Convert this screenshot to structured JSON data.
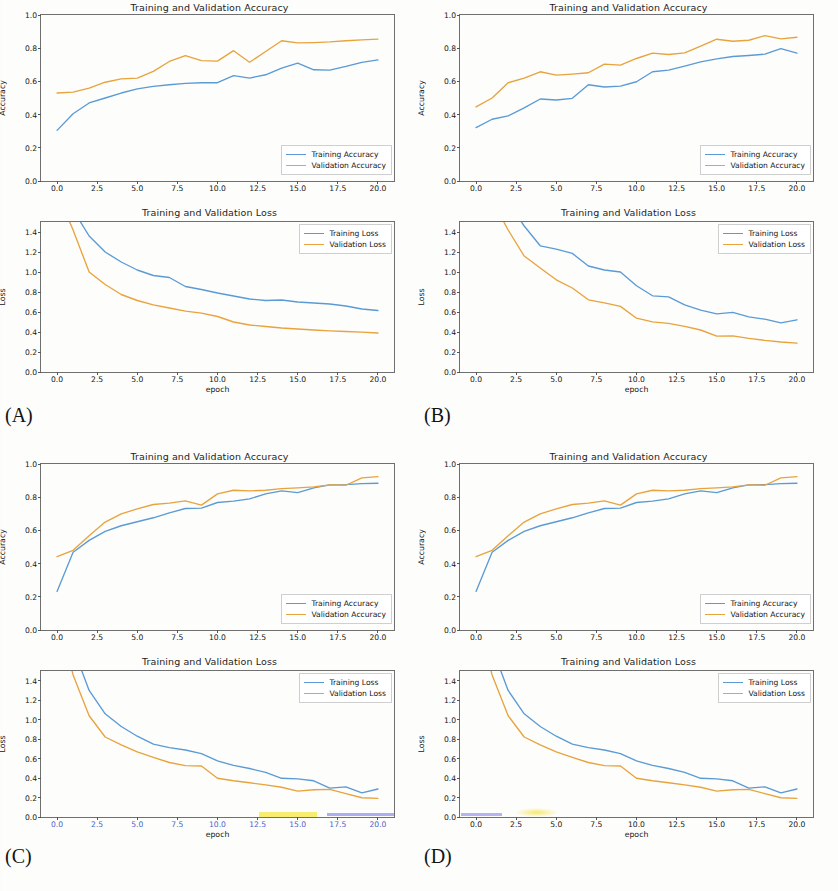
{
  "figure": {
    "panels": [
      {
        "id": "A",
        "caption": "(A)"
      },
      {
        "id": "B",
        "caption": "(B)"
      },
      {
        "id": "C",
        "caption": "(C)"
      },
      {
        "id": "D",
        "caption": "(D)"
      }
    ],
    "colors": {
      "training": "#5b9bd5",
      "validation": "#e8a33d",
      "axis": "#6f6f6f",
      "text": "#151515"
    },
    "titles": {
      "accuracy": "Training and Validation Accuracy",
      "loss": "Training and Validation Loss"
    },
    "axis_labels": {
      "accuracy_y": "Accuracy",
      "loss_y": "Loss",
      "x": "epoch"
    },
    "legend_labels": {
      "training_accuracy": "Training Accuracy",
      "validation_accuracy": "Validation Accuracy",
      "training_loss": "Training Loss",
      "validation_loss": "Validation Loss"
    },
    "ticks": {
      "x": [
        "0.0",
        "2.5",
        "5.0",
        "7.5",
        "10.0",
        "12.5",
        "15.0",
        "17.5",
        "20.0"
      ],
      "y_accuracy": [
        "0.0",
        "0.2",
        "0.4",
        "0.6",
        "0.8",
        "1.0"
      ],
      "y_loss": [
        "0.0",
        "0.2",
        "0.4",
        "0.6",
        "0.8",
        "1.0",
        "1.2",
        "1.4"
      ]
    }
  },
  "chart_data": [
    {
      "id": "A-accuracy",
      "panel": "A",
      "type": "line",
      "title": "Training and Validation Accuracy",
      "xlabel": "",
      "ylabel": "Accuracy",
      "xlim": [
        -1.0,
        21.0
      ],
      "ylim": [
        0.0,
        1.0
      ],
      "xticks": [
        0.0,
        2.5,
        5.0,
        7.5,
        10.0,
        12.5,
        15.0,
        17.5,
        20.0
      ],
      "yticks": [
        0.0,
        0.2,
        0.4,
        0.6,
        0.8,
        1.0
      ],
      "grid": false,
      "legend_position": "lower right",
      "x": [
        0,
        1,
        2,
        3,
        4,
        5,
        6,
        7,
        8,
        9,
        10,
        11,
        12,
        13,
        14,
        15,
        16,
        17,
        18,
        19,
        20
      ],
      "series": [
        {
          "name": "Training Accuracy",
          "color": "#5b9bd5",
          "values": [
            0.305,
            0.405,
            0.47,
            0.5,
            0.53,
            0.555,
            0.57,
            0.58,
            0.588,
            0.592,
            0.592,
            0.635,
            0.62,
            0.64,
            0.68,
            0.71,
            0.67,
            0.668,
            0.69,
            0.715,
            0.73
          ]
        },
        {
          "name": "Validation Accuracy",
          "color": "#e8a33d",
          "values": [
            0.53,
            0.535,
            0.56,
            0.595,
            0.615,
            0.62,
            0.66,
            0.72,
            0.755,
            0.725,
            0.722,
            0.785,
            0.715,
            0.78,
            0.845,
            0.832,
            0.834,
            0.838,
            0.845,
            0.85,
            0.855
          ]
        }
      ]
    },
    {
      "id": "A-loss",
      "panel": "A",
      "type": "line",
      "title": "Training and Validation Loss",
      "xlabel": "epoch",
      "ylabel": "Loss",
      "xlim": [
        -1.0,
        21.0
      ],
      "ylim": [
        0.0,
        1.5
      ],
      "xticks": [
        0.0,
        2.5,
        5.0,
        7.5,
        10.0,
        12.5,
        15.0,
        17.5,
        20.0
      ],
      "yticks": [
        0.0,
        0.2,
        0.4,
        0.6,
        0.8,
        1.0,
        1.2,
        1.4
      ],
      "grid": false,
      "legend_position": "upper right",
      "x": [
        0,
        1,
        2,
        3,
        4,
        5,
        6,
        7,
        8,
        9,
        10,
        11,
        12,
        13,
        14,
        15,
        16,
        17,
        18,
        19,
        20
      ],
      "series": [
        {
          "name": "Training Loss",
          "color": "#5b9bd5",
          "values": [
            2.05,
            1.62,
            1.36,
            1.2,
            1.1,
            1.02,
            0.965,
            0.945,
            0.855,
            0.825,
            0.79,
            0.76,
            0.73,
            0.715,
            0.72,
            0.7,
            0.69,
            0.68,
            0.66,
            0.63,
            0.615
          ]
        },
        {
          "name": "Validation Loss",
          "color": "#e8a33d",
          "values": [
            1.8,
            1.42,
            1.0,
            0.875,
            0.775,
            0.715,
            0.672,
            0.64,
            0.608,
            0.588,
            0.555,
            0.5,
            0.47,
            0.455,
            0.44,
            0.43,
            0.42,
            0.412,
            0.405,
            0.398,
            0.39
          ]
        }
      ]
    },
    {
      "id": "B-accuracy",
      "panel": "B",
      "type": "line",
      "title": "Training and Validation Accuracy",
      "xlabel": "",
      "ylabel": "Accuracy",
      "xlim": [
        -1.0,
        21.0
      ],
      "ylim": [
        0.0,
        1.0
      ],
      "xticks": [
        0.0,
        2.5,
        5.0,
        7.5,
        10.0,
        12.5,
        15.0,
        17.5,
        20.0
      ],
      "yticks": [
        0.0,
        0.2,
        0.4,
        0.6,
        0.8,
        1.0
      ],
      "grid": false,
      "legend_position": "lower right",
      "x": [
        0,
        1,
        2,
        3,
        4,
        5,
        6,
        7,
        8,
        9,
        10,
        11,
        12,
        13,
        14,
        15,
        16,
        17,
        18,
        19,
        20
      ],
      "series": [
        {
          "name": "Training Accuracy",
          "color": "#5b9bd5",
          "values": [
            0.322,
            0.372,
            0.392,
            0.44,
            0.494,
            0.488,
            0.498,
            0.58,
            0.566,
            0.572,
            0.598,
            0.658,
            0.668,
            0.692,
            0.718,
            0.736,
            0.75,
            0.756,
            0.764,
            0.798,
            0.77
          ]
        },
        {
          "name": "Validation Accuracy",
          "color": "#e8a33d",
          "values": [
            0.446,
            0.5,
            0.592,
            0.62,
            0.658,
            0.638,
            0.644,
            0.652,
            0.704,
            0.698,
            0.738,
            0.77,
            0.762,
            0.772,
            0.812,
            0.854,
            0.842,
            0.848,
            0.876,
            0.856,
            0.866
          ]
        }
      ]
    },
    {
      "id": "B-loss",
      "panel": "B",
      "type": "line",
      "title": "Training and Validation Loss",
      "xlabel": "epoch",
      "ylabel": "Loss",
      "xlim": [
        -1.0,
        21.0
      ],
      "ylim": [
        0.0,
        1.5
      ],
      "xticks": [
        0.0,
        2.5,
        5.0,
        7.5,
        10.0,
        12.5,
        15.0,
        17.5,
        20.0
      ],
      "yticks": [
        0.0,
        0.2,
        0.4,
        0.6,
        0.8,
        1.0,
        1.2,
        1.4
      ],
      "grid": false,
      "legend_position": "upper right",
      "x": [
        0,
        1,
        2,
        3,
        4,
        5,
        6,
        7,
        8,
        9,
        10,
        11,
        12,
        13,
        14,
        15,
        16,
        17,
        18,
        19,
        20
      ],
      "series": [
        {
          "name": "Training Loss",
          "color": "#5b9bd5",
          "values": [
            2.2,
            1.95,
            1.7,
            1.46,
            1.262,
            1.228,
            1.186,
            1.06,
            1.02,
            1.0,
            0.862,
            0.762,
            0.752,
            0.672,
            0.618,
            0.582,
            0.596,
            0.552,
            0.528,
            0.492,
            0.522
          ]
        },
        {
          "name": "Validation Loss",
          "color": "#e8a33d",
          "values": [
            2.0,
            1.72,
            1.42,
            1.16,
            1.04,
            0.922,
            0.84,
            0.722,
            0.692,
            0.656,
            0.538,
            0.502,
            0.486,
            0.456,
            0.42,
            0.358,
            0.362,
            0.336,
            0.316,
            0.3,
            0.288
          ]
        }
      ]
    },
    {
      "id": "C-accuracy",
      "panel": "C",
      "type": "line",
      "title": "Training and Validation Accuracy",
      "xlabel": "",
      "ylabel": "Accuracy",
      "xlim": [
        -1.0,
        21.0
      ],
      "ylim": [
        0.0,
        1.0
      ],
      "xticks": [
        0.0,
        2.5,
        5.0,
        7.5,
        10.0,
        12.5,
        15.0,
        17.5,
        20.0
      ],
      "yticks": [
        0.0,
        0.2,
        0.4,
        0.6,
        0.8,
        1.0
      ],
      "grid": false,
      "legend_position": "lower right",
      "x": [
        0,
        1,
        2,
        3,
        4,
        5,
        6,
        7,
        8,
        9,
        10,
        11,
        12,
        13,
        14,
        15,
        16,
        17,
        18,
        19,
        20
      ],
      "series": [
        {
          "name": "Training Accuracy",
          "color": "#5b9bd5",
          "values": [
            0.232,
            0.468,
            0.54,
            0.594,
            0.628,
            0.652,
            0.676,
            0.706,
            0.732,
            0.734,
            0.768,
            0.776,
            0.79,
            0.82,
            0.838,
            0.828,
            0.856,
            0.874,
            0.876,
            0.882,
            0.884
          ]
        },
        {
          "name": "Validation Accuracy",
          "color": "#e8a33d",
          "values": [
            0.442,
            0.48,
            0.568,
            0.65,
            0.7,
            0.73,
            0.756,
            0.764,
            0.778,
            0.752,
            0.82,
            0.842,
            0.838,
            0.842,
            0.852,
            0.856,
            0.862,
            0.874,
            0.872,
            0.916,
            0.924
          ]
        }
      ]
    },
    {
      "id": "C-loss",
      "panel": "C",
      "type": "line",
      "title": "Training and Validation Loss",
      "xlabel": "epoch",
      "ylabel": "Loss",
      "xlim": [
        -1.0,
        21.0
      ],
      "ylim": [
        0.0,
        1.5
      ],
      "xticks": [
        0.0,
        2.5,
        5.0,
        7.5,
        10.0,
        12.5,
        15.0,
        17.5,
        20.0
      ],
      "yticks": [
        0.0,
        0.2,
        0.4,
        0.6,
        0.8,
        1.0,
        1.2,
        1.4
      ],
      "grid": false,
      "legend_position": "upper right",
      "x": [
        0,
        1,
        2,
        3,
        4,
        5,
        6,
        7,
        8,
        9,
        10,
        11,
        12,
        13,
        14,
        15,
        16,
        17,
        18,
        19,
        20
      ],
      "series": [
        {
          "name": "Training Loss",
          "color": "#5b9bd5",
          "values": [
            2.3,
            1.74,
            1.3,
            1.06,
            0.93,
            0.83,
            0.748,
            0.712,
            0.688,
            0.652,
            0.576,
            0.53,
            0.498,
            0.458,
            0.398,
            0.392,
            0.372,
            0.296,
            0.31,
            0.248,
            0.288
          ]
        },
        {
          "name": "Validation Loss",
          "color": "#e8a33d",
          "values": [
            2.1,
            1.46,
            1.04,
            0.822,
            0.742,
            0.668,
            0.612,
            0.56,
            0.528,
            0.524,
            0.398,
            0.372,
            0.352,
            0.33,
            0.306,
            0.266,
            0.28,
            0.284,
            0.24,
            0.198,
            0.192
          ]
        }
      ]
    },
    {
      "id": "D-accuracy",
      "panel": "D",
      "type": "line",
      "title": "Training and Validation Accuracy",
      "xlabel": "",
      "ylabel": "Accuracy",
      "xlim": [
        -1.0,
        21.0
      ],
      "ylim": [
        0.0,
        1.0
      ],
      "xticks": [
        0.0,
        2.5,
        5.0,
        7.5,
        10.0,
        12.5,
        15.0,
        17.5,
        20.0
      ],
      "yticks": [
        0.0,
        0.2,
        0.4,
        0.6,
        0.8,
        1.0
      ],
      "grid": false,
      "legend_position": "lower right",
      "x": [
        0,
        1,
        2,
        3,
        4,
        5,
        6,
        7,
        8,
        9,
        10,
        11,
        12,
        13,
        14,
        15,
        16,
        17,
        18,
        19,
        20
      ],
      "series": [
        {
          "name": "Training Accuracy",
          "color": "#5b9bd5",
          "values": [
            0.232,
            0.468,
            0.54,
            0.594,
            0.628,
            0.652,
            0.676,
            0.706,
            0.732,
            0.734,
            0.768,
            0.776,
            0.79,
            0.82,
            0.838,
            0.828,
            0.856,
            0.874,
            0.876,
            0.882,
            0.884
          ]
        },
        {
          "name": "Validation Accuracy",
          "color": "#e8a33d",
          "values": [
            0.442,
            0.48,
            0.568,
            0.65,
            0.7,
            0.73,
            0.756,
            0.764,
            0.778,
            0.752,
            0.82,
            0.842,
            0.838,
            0.842,
            0.852,
            0.856,
            0.862,
            0.874,
            0.872,
            0.916,
            0.924
          ]
        }
      ]
    },
    {
      "id": "D-loss",
      "panel": "D",
      "type": "line",
      "title": "Training and Validation Loss",
      "xlabel": "epoch",
      "ylabel": "Loss",
      "xlim": [
        -1.0,
        21.0
      ],
      "ylim": [
        0.0,
        1.5
      ],
      "xticks": [
        0.0,
        2.5,
        5.0,
        7.5,
        10.0,
        12.5,
        15.0,
        17.5,
        20.0
      ],
      "yticks": [
        0.0,
        0.2,
        0.4,
        0.6,
        0.8,
        1.0,
        1.2,
        1.4
      ],
      "grid": false,
      "legend_position": "upper right",
      "x": [
        0,
        1,
        2,
        3,
        4,
        5,
        6,
        7,
        8,
        9,
        10,
        11,
        12,
        13,
        14,
        15,
        16,
        17,
        18,
        19,
        20
      ],
      "series": [
        {
          "name": "Training Loss",
          "color": "#5b9bd5",
          "values": [
            2.3,
            1.74,
            1.3,
            1.06,
            0.93,
            0.83,
            0.748,
            0.712,
            0.688,
            0.652,
            0.576,
            0.53,
            0.498,
            0.458,
            0.398,
            0.392,
            0.372,
            0.296,
            0.31,
            0.248,
            0.288
          ]
        },
        {
          "name": "Validation Loss",
          "color": "#e8a33d",
          "values": [
            2.1,
            1.46,
            1.04,
            0.822,
            0.742,
            0.668,
            0.612,
            0.56,
            0.528,
            0.524,
            0.398,
            0.372,
            0.352,
            0.33,
            0.306,
            0.266,
            0.28,
            0.284,
            0.24,
            0.198,
            0.192
          ]
        }
      ]
    }
  ]
}
